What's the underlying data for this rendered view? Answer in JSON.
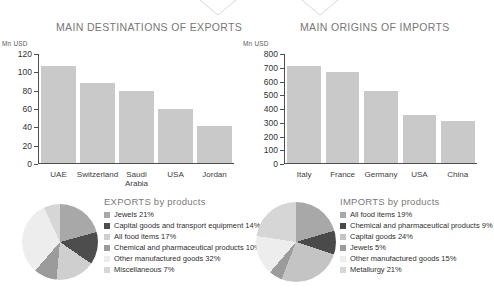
{
  "decor": {
    "triangles": [
      {
        "name": "triangle-marker-exports",
        "x": 188
      },
      {
        "name": "triangle-marker-imports",
        "x": 290
      }
    ],
    "triangle_color": "#d8d8d8"
  },
  "sections": {
    "exports_title": "MAIN DESTINATIONS OF EXPORTS",
    "imports_title": "MAIN ORIGINS OF IMPORTS"
  },
  "chart_data": [
    {
      "type": "bar",
      "name": "main-destinations-of-exports",
      "title": "MAIN DESTINATIONS OF EXPORTS",
      "xlabel": "",
      "ylabel": "Mn USD",
      "unit_label": "Mn USD",
      "categories": [
        "UAE",
        "Switzerland",
        "Saudi Arabia",
        "USA",
        "Jordan"
      ],
      "values": [
        107,
        88,
        79,
        60,
        41
      ],
      "ylim": [
        0,
        120
      ],
      "yticks": [
        120,
        100,
        80,
        60,
        40,
        20,
        0
      ],
      "grid": false,
      "bar_color": "#c9c9c9"
    },
    {
      "type": "bar",
      "name": "main-origins-of-imports",
      "title": "MAIN ORIGINS OF IMPORTS",
      "xlabel": "",
      "ylabel": "Mn USD",
      "unit_label": "Mn USD",
      "categories": [
        "Italy",
        "France",
        "Germany",
        "USA",
        "China"
      ],
      "values": [
        710,
        670,
        525,
        352,
        305
      ],
      "ylim": [
        0,
        800
      ],
      "yticks": [
        800,
        700,
        600,
        500,
        400,
        300,
        200,
        100,
        0
      ],
      "grid": false,
      "bar_color": "#c9c9c9"
    },
    {
      "type": "pie",
      "name": "exports-by-products",
      "title": "EXPORTS by products",
      "labels": [
        "Jewels 21%",
        "Capital goods and transport equipment 14%",
        "All food items 17%",
        "Chemical and pharmaceutical products 10%",
        "Other manufactured goods 32%",
        "Miscellaneous 7%"
      ],
      "categories": [
        "Jewels",
        "Capital goods and transport equipment",
        "All food items",
        "Chemical and pharmaceutical products",
        "Other manufactured goods",
        "Miscellaneous"
      ],
      "values": [
        21,
        14,
        17,
        10,
        32,
        7
      ],
      "colors": [
        "#a8a8a8",
        "#4d4d4d",
        "#cfcfcf",
        "#9b9b9b",
        "#ededed",
        "#d6d6d6"
      ],
      "legend_position": "right"
    },
    {
      "type": "pie",
      "name": "imports-by-products",
      "title": "IMPORTS by products",
      "labels": [
        "All food items 19%",
        "Chemical and pharmaceutical products 9%",
        "Capital goods 24%",
        "Jewels 5%",
        "Other manufactured goods 15%",
        "Metallurgy 21%"
      ],
      "categories": [
        "All food items",
        "Chemical and pharmaceutical products",
        "Capital goods",
        "Jewels",
        "Other manufactured goods",
        "Metallurgy"
      ],
      "values": [
        19,
        9,
        24,
        5,
        15,
        21
      ],
      "colors": [
        "#a8a8a8",
        "#4a4a4a",
        "#c4c4c4",
        "#9b9b9b",
        "#ededed",
        "#d6d6d6"
      ],
      "legend_position": "right"
    }
  ]
}
